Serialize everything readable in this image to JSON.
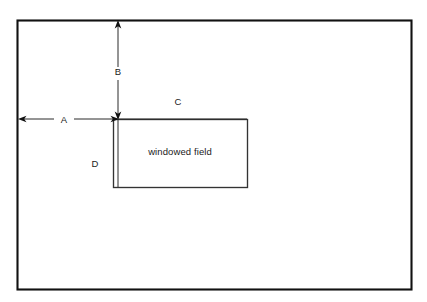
{
  "diagram": {
    "colors": {
      "background": "#ffffff",
      "outer_border": "#111111",
      "inner_border": "#333333",
      "dimension_line": "#2a2a2a",
      "text": "#1a1a1a"
    },
    "outer_frame": {
      "name": "full field boundary",
      "x": 17,
      "y": 20,
      "width": 395,
      "height": 270
    },
    "inner_frame": {
      "name": "windowed field boundary",
      "label": "windowed field",
      "x": 113,
      "y": 119,
      "width": 135,
      "height": 69
    },
    "dimensions": [
      {
        "id": "A",
        "label": "A",
        "orientation": "horizontal",
        "description": "horizontal offset from left edge of full field to left edge of windowed field",
        "from_x": 18,
        "to_x": 118,
        "y": 119,
        "label_x": 64,
        "label_y": 122,
        "arrowheads": "both"
      },
      {
        "id": "B",
        "label": "B",
        "orientation": "vertical",
        "description": "vertical offset from top edge of full field to top edge of windowed field",
        "x": 118,
        "from_y": 21,
        "to_y": 119,
        "label_x": 118,
        "label_y": 75,
        "arrowheads": "both"
      },
      {
        "id": "C",
        "label": "C",
        "orientation": "horizontal",
        "description": "width of the windowed field",
        "label_x": 178,
        "label_y": 105,
        "arrowheads": "none"
      },
      {
        "id": "D",
        "label": "D",
        "orientation": "vertical",
        "description": "height of the windowed field",
        "label_x": 95,
        "label_y": 167,
        "arrowheads": "none"
      }
    ]
  }
}
